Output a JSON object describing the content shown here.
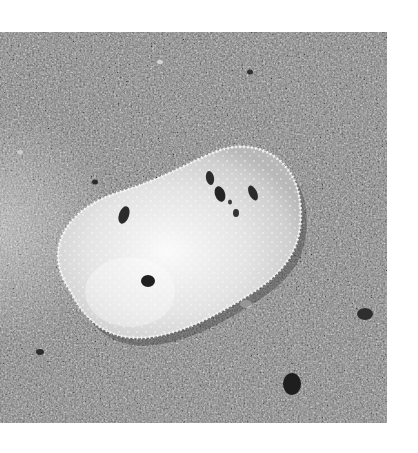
{
  "image": {
    "subject": "white sea slug (nudibranch) on sand",
    "description": "Grayscale photo of an oval, pale, spiky-edged nudibranch with a few dark spots resting on coarse gray gravel",
    "colors": {
      "background": "#ffffff",
      "gravel_mid": "#8a8a8a",
      "gravel_dark": "#3a3a3a",
      "gravel_light": "#c4c4c4",
      "slug_body": "#e6e6e6",
      "slug_center": "#f6f6f6",
      "spots": "#2a2a2a"
    },
    "bounds": {
      "x": 0,
      "y": 32,
      "width": 387,
      "height": 391
    }
  }
}
